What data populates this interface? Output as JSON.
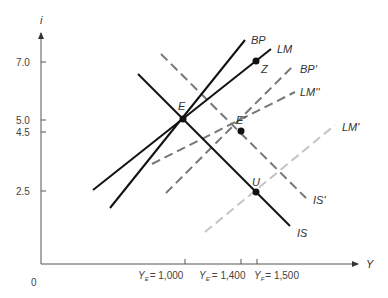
{
  "diagram": {
    "type": "IS-LM-BP diagram",
    "y_axis": {
      "label": "i",
      "ticks": [
        {
          "label": "7.0",
          "value": 7.0
        },
        {
          "label": "5.0",
          "value": 5.0
        },
        {
          "label": "4.5",
          "value": 4.5
        },
        {
          "label": "2.5",
          "value": 2.5
        }
      ]
    },
    "x_axis": {
      "label": "Y",
      "origin_label": "0",
      "ticks": [
        {
          "name": "Y",
          "sub": "E",
          "value_label": "= 1,000",
          "value": 1000
        },
        {
          "name": "Y",
          "sub": "E'",
          "value_label": "= 1,400",
          "value": 1400
        },
        {
          "name": "Y",
          "sub": "F",
          "value_label": "= 1,500",
          "value": 1500
        }
      ]
    },
    "curves": [
      {
        "label": "BP",
        "style": "solid"
      },
      {
        "label": "LM",
        "style": "solid"
      },
      {
        "label": "IS",
        "style": "solid"
      },
      {
        "label": "BP'",
        "style": "dashed-dark"
      },
      {
        "label": "LM''",
        "style": "dashed-dark"
      },
      {
        "label": "IS'",
        "style": "dashed-dark"
      },
      {
        "label": "LM'",
        "style": "dashed-light"
      }
    ],
    "points": [
      {
        "label": "E",
        "Y": 1000,
        "i": 5.0
      },
      {
        "label": "E'",
        "Y": 1400,
        "i": 4.5
      },
      {
        "label": "Z",
        "Y": 1500,
        "i": 7.0
      },
      {
        "label": "U",
        "Y": 1500,
        "i": 2.5
      }
    ],
    "colors": {
      "solid": "#111111",
      "dashed_dark": "#777777",
      "dashed_light": "#c4c4c4",
      "axis": "#555555"
    }
  }
}
